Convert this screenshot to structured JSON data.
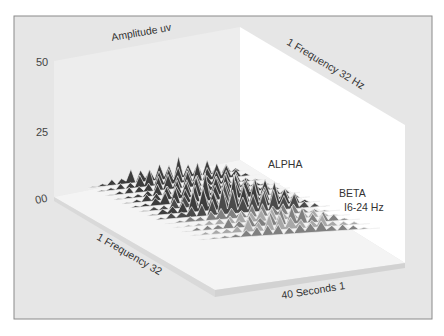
{
  "chart_data": {
    "type": "surface3d",
    "title": "",
    "axes": {
      "z": {
        "label": "Amplitude uv",
        "ticks": [
          "50",
          "25",
          "00"
        ],
        "range": [
          0,
          50
        ]
      },
      "x_back": {
        "label": "1 Frequency 32 Hz"
      },
      "y_left": {
        "label": "1 Frequency 32"
      },
      "time": {
        "label": "40 Seconds 1"
      }
    },
    "annotations": [
      {
        "text": "ALPHA",
        "band": "alpha"
      },
      {
        "text": "BETA",
        "band": "beta"
      },
      {
        "text": "I6-24 Hz",
        "band": "beta-range"
      }
    ],
    "bands": [
      {
        "name": "ALPHA",
        "approx_peak_amplitude": 18
      },
      {
        "name": "BETA",
        "range_hz": "16-24",
        "approx_peak_amplitude": 12
      }
    ],
    "colors": {
      "frame": "#e6e6e6",
      "back_wall_left": "#ececec",
      "back_wall_right": "#ffffff",
      "floor": "#e2e2e2",
      "surface_dark": "#3c3c3c",
      "surface_mid": "#808080",
      "surface_light": "#a8a8a8",
      "mesh": "#f2f2f2"
    },
    "grid": false,
    "legend": "none"
  },
  "labels": {
    "amplitude": "Amplitude uv",
    "freq_hz": "1 Frequency 32 Hz",
    "freq_left": "1 Frequency 32",
    "seconds": "40 Seconds 1",
    "alpha": "ALPHA",
    "beta": "BETA",
    "beta_range": "I6-24 Hz",
    "tick_50": "50",
    "tick_25": "25",
    "tick_00": "00"
  }
}
